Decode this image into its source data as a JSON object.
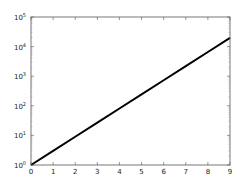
{
  "chart_data": {
    "type": "line",
    "title": "",
    "xlabel": "",
    "ylabel": "",
    "yscale": "log",
    "xlim": [
      0,
      9
    ],
    "ylim": [
      1,
      100000
    ],
    "grid": false,
    "legend": null,
    "xticks": [
      "0",
      "1",
      "2",
      "3",
      "4",
      "5",
      "6",
      "7",
      "8",
      "9"
    ],
    "yticks": [
      {
        "base": "10",
        "exp": "0"
      },
      {
        "base": "10",
        "exp": "1"
      },
      {
        "base": "10",
        "exp": "2"
      },
      {
        "base": "10",
        "exp": "3"
      },
      {
        "base": "10",
        "exp": "4"
      },
      {
        "base": "10",
        "exp": "5"
      }
    ],
    "series": [
      {
        "name": "y = 3^x",
        "color": "#000000",
        "x": [
          0,
          1,
          2,
          3,
          4,
          5,
          6,
          7,
          8,
          9
        ],
        "values": [
          1,
          3,
          9,
          27,
          81,
          243,
          729,
          2187,
          6561,
          19683
        ]
      }
    ]
  },
  "colors": {
    "axes": "#555555",
    "line": "#000000",
    "background": "#ffffff"
  }
}
